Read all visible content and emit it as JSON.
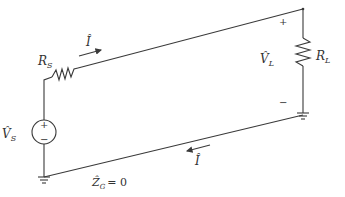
{
  "diagram": {
    "type": "circuit",
    "components": {
      "source_resistor": {
        "label": "R",
        "sub": "S"
      },
      "load_resistor": {
        "label": "R",
        "sub": "L"
      },
      "source_voltage": {
        "label": "V̂",
        "sub": "S",
        "plus": "+",
        "minus": "−"
      },
      "load_voltage": {
        "label": "V̂",
        "sub": "L",
        "plus": "+",
        "minus": "−"
      },
      "ground_impedance": {
        "label": "Ẑ",
        "sub": "G",
        "value": "= 0"
      }
    },
    "currents": {
      "top": {
        "label": "Î",
        "direction": "right"
      },
      "bottom": {
        "label": "Î",
        "direction": "left"
      }
    },
    "colors": {
      "wire": "#3a3a3a",
      "text": "#333333"
    }
  }
}
